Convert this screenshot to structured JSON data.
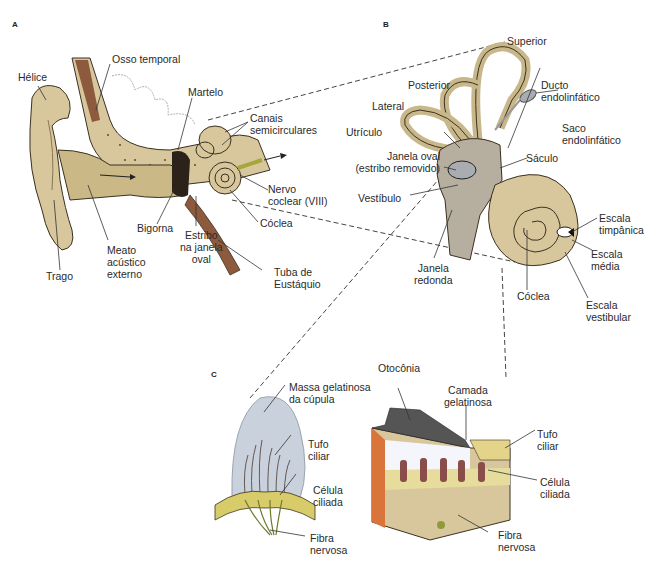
{
  "figure": {
    "panels": [
      {
        "id": "A",
        "title": "A"
      },
      {
        "id": "B",
        "title": "B"
      },
      {
        "id": "C",
        "title": "C"
      }
    ],
    "colors": {
      "bone_tan": "#d8c79c",
      "bone_dark": "#b89f6a",
      "labyrinth_gray": "#a9acb0",
      "cupula_blue": "#c9d1dc",
      "hair_cell_brown": "#8a4e4a",
      "support_yellow": "#d8cc6a",
      "base_orange": "#d9743a",
      "nerve_green": "#8f9a3a",
      "leader_line": "#333333"
    }
  },
  "panel_a": {
    "labels": {
      "helice": "Hélice",
      "osso_temporal": "Osso temporal",
      "martelo": "Martelo",
      "canais_1": "Canais",
      "canais_2": "semicirculares",
      "nervo_1": "Nervo",
      "nervo_2": "coclear (VIII)",
      "coclea": "Cóclea",
      "bigorna": "Bigorna",
      "estribo_1": "Estribo",
      "estribo_2": "na janela",
      "estribo_3": "oval",
      "meato_1": "Meato",
      "meato_2": "acústico",
      "meato_3": "externo",
      "trago": "Trago",
      "tuba_1": "Tuba de",
      "tuba_2": "Eustáquio"
    }
  },
  "panel_b": {
    "labels": {
      "superior": "Superior",
      "posterior": "Posterior",
      "lateral": "Lateral",
      "ducto_1": "Ducto",
      "ducto_2": "endolinfático",
      "saco_1": "Saco",
      "saco_2": "endolinfático",
      "utriculo": "Utrículo",
      "janela_oval_1": "Janela oval",
      "janela_oval_2": "(estribo removido)",
      "saculo": "Sáculo",
      "vestibulo": "Vestíbulo",
      "escala_timp_1": "Escala",
      "escala_timp_2": "timpânica",
      "escala_media_1": "Escala",
      "escala_media_2": "média",
      "janela_redonda_1": "Janela",
      "janela_redonda_2": "redonda",
      "coclea": "Cóclea",
      "escala_vest_1": "Escala",
      "escala_vest_2": "vestibular"
    }
  },
  "panel_c": {
    "labels": {
      "massa_1": "Massa gelatinosa",
      "massa_2": "da cúpula",
      "tufo_left_1": "Tufo",
      "tufo_left_2": "ciliar",
      "celula_left_1": "Célula",
      "celula_left_2": "ciliada",
      "fibra_left_1": "Fibra",
      "fibra_left_2": "nervosa",
      "otoconia": "Otocônia",
      "camada_1": "Camada",
      "camada_2": "gelatinosa",
      "tufo_right_1": "Tufo",
      "tufo_right_2": "ciliar",
      "celula_right_1": "Célula",
      "celula_right_2": "ciliada",
      "fibra_right_1": "Fibra",
      "fibra_right_2": "nervosa"
    }
  }
}
